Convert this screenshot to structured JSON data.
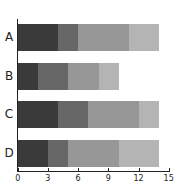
{
  "chart_data": {
    "type": "bar",
    "orientation": "horizontal",
    "stacked": true,
    "title": "",
    "xlabel": "",
    "ylabel": "",
    "categories": [
      "A",
      "B",
      "C",
      "D"
    ],
    "series": [
      {
        "name": "Series 1",
        "color": "#3a3a3a",
        "values": [
          4,
          2,
          4,
          3
        ]
      },
      {
        "name": "Series 2",
        "color": "#676767",
        "values": [
          2,
          3,
          3,
          2
        ]
      },
      {
        "name": "Series 3",
        "color": "#979797",
        "values": [
          5,
          3,
          5,
          5
        ]
      },
      {
        "name": "Series 4",
        "color": "#b4b4b4",
        "values": [
          3,
          2,
          2,
          4
        ]
      }
    ],
    "totals": [
      14,
      10,
      14,
      14
    ],
    "xlim": [
      0,
      15
    ],
    "xticks": [
      0,
      3,
      6,
      9,
      12,
      15
    ],
    "grid": false,
    "legend": "none"
  }
}
